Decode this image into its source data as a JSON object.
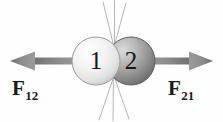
{
  "figure": {
    "background_color": "#fefefe",
    "width": 223,
    "height": 122
  },
  "balls": [
    {
      "id": "ball-1",
      "number": "1",
      "cx": 96,
      "cy": 61,
      "r": 24,
      "fill_light": "#fdfdfd",
      "fill_mid": "#ebebeb",
      "fill_dark": "#c8c8c8",
      "stroke": "#9a9a9a",
      "shade": "light"
    },
    {
      "id": "ball-2",
      "number": "2",
      "cx": 131,
      "cy": 61,
      "r": 24,
      "fill_light": "#cfcfcf",
      "fill_mid": "#a5a5a5",
      "fill_dark": "#6e6e6e",
      "stroke": "#5f5f5f",
      "shade": "dark"
    }
  ],
  "contact_point": {
    "x": 114,
    "y": 61
  },
  "arrows": [
    {
      "id": "arrow-f12",
      "direction": "left",
      "label": "F",
      "subscript": "12",
      "tail_x": 86,
      "tip_x": 10,
      "y": 61,
      "shaft_thickness": 7,
      "head_length": 24,
      "head_width": 19,
      "color": "#8a8a8a",
      "color_dark": "#6b6b6b"
    },
    {
      "id": "arrow-f21",
      "direction": "right",
      "label": "F",
      "subscript": "21",
      "tail_x": 141,
      "tip_x": 213,
      "y": 61,
      "shaft_thickness": 7,
      "head_length": 24,
      "head_width": 19,
      "color": "#8a8a8a",
      "color_dark": "#6b6b6b"
    }
  ],
  "impact_lines": {
    "color": "#b4b4b4",
    "stroke_width": 1,
    "origin_gap": 14,
    "upper": [
      {
        "x1": 114,
        "y1": 47,
        "x2": 103,
        "y2": 2
      },
      {
        "x1": 114,
        "y1": 47,
        "x2": 114,
        "y2": 1
      },
      {
        "x1": 114,
        "y1": 47,
        "x2": 126,
        "y2": 3
      }
    ],
    "lower": [
      {
        "x1": 114,
        "y1": 76,
        "x2": 99,
        "y2": 120
      },
      {
        "x1": 114,
        "y1": 76,
        "x2": 113,
        "y2": 121
      },
      {
        "x1": 114,
        "y1": 76,
        "x2": 129,
        "y2": 119
      }
    ]
  },
  "labels": {
    "f12": {
      "symbol": "F",
      "subscript": "12"
    },
    "f21": {
      "symbol": "F",
      "subscript": "21"
    }
  }
}
